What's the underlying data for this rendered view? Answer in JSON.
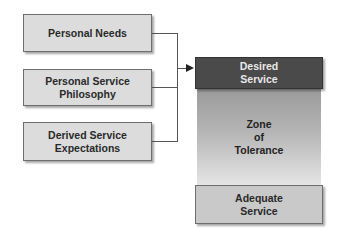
{
  "inputs": [
    {
      "label_line1": "Personal Needs",
      "label_line2": ""
    },
    {
      "label_line1": "Personal Service",
      "label_line2": "Philosophy"
    },
    {
      "label_line1": "Derived Service",
      "label_line2": "Expectations"
    }
  ],
  "service_levels": {
    "desired": {
      "line1": "Desired",
      "line2": "Service"
    },
    "zone": {
      "line1": "Zone",
      "line2": "of",
      "line3": "Tolerance"
    },
    "adequate": {
      "line1": "Adequate",
      "line2": "Service"
    }
  },
  "colors": {
    "input_box": "#dcdcdc",
    "desired_box": "#4a4a4a",
    "zone_gradient_top": "#9a9a9a",
    "zone_gradient_bottom": "#e6e6e6",
    "adequate_box": "#c9c9c9"
  }
}
